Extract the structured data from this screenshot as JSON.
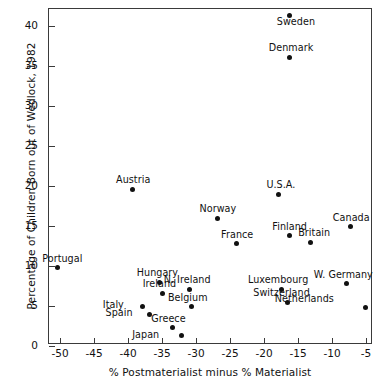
{
  "chart_data": {
    "type": "scatter",
    "title": "",
    "xlabel": "% Postmaterialist minus % Materialist",
    "ylabel": "Percentage of Children Born out of Wedlock, 1982",
    "xlim": [
      -52.5,
      -3.5
    ],
    "ylim": [
      -0.6,
      42.0
    ],
    "xticks": [
      -50,
      -45,
      -40,
      -35,
      -30,
      -25,
      -20,
      -15,
      -10,
      -5
    ],
    "yticks": [
      0,
      5,
      10,
      15,
      20,
      25,
      30,
      35,
      40
    ],
    "xticklabels": [
      "-50",
      "-45",
      "-40",
      "-35",
      "-30",
      "-25",
      "-20",
      "-15",
      "-10",
      "-5"
    ],
    "yticklabels": [
      "0",
      "5",
      "10",
      "15",
      "20",
      "25",
      "30",
      "35",
      "40"
    ],
    "grid": false,
    "legend": false,
    "marker_color": "#111111",
    "frame_color": "#3a3a3a",
    "points": [
      {
        "label": "Sweden",
        "x": -16.2,
        "y": 41.3,
        "lx": 6,
        "ly": 11
      },
      {
        "label": "Denmark",
        "x": -16.2,
        "y": 36.1,
        "lx": 1,
        "ly": -4
      },
      {
        "label": "Austria",
        "x": -39.4,
        "y": 19.6,
        "lx": 1,
        "ly": -4
      },
      {
        "label": "U.S.A.",
        "x": -17.8,
        "y": 19.0,
        "lx": 2,
        "ly": -4
      },
      {
        "label": "Norway",
        "x": -26.9,
        "y": 16.0,
        "lx": 1,
        "ly": -4
      },
      {
        "label": "Canada",
        "x": -7.3,
        "y": 14.9,
        "lx": 1,
        "ly": -4
      },
      {
        "label": "Finland",
        "x": -16.2,
        "y": 13.8,
        "lx": 0,
        "ly": -4
      },
      {
        "label": "Britain",
        "x": -13.2,
        "y": 13.0,
        "lx": 4,
        "ly": -4
      },
      {
        "label": "France",
        "x": -24.1,
        "y": 12.8,
        "lx": 1,
        "ly": -4
      },
      {
        "label": "Portugal",
        "x": -50.4,
        "y": 9.8,
        "lx": 5,
        "ly": -4
      },
      {
        "label": "Hungary",
        "x": -35.4,
        "y": 8.0,
        "lx": -2,
        "ly": -4
      },
      {
        "label": "N. Ireland",
        "x": -31.0,
        "y": 7.1,
        "lx": -2,
        "ly": -4
      },
      {
        "label": "Luxembourg",
        "x": -17.5,
        "y": 7.1,
        "lx": -3,
        "ly": -4
      },
      {
        "label": "W. Germany",
        "x": -7.9,
        "y": 7.8,
        "lx": -3,
        "ly": -4
      },
      {
        "label": "Ireland",
        "x": -34.9,
        "y": 6.6,
        "lx": -3,
        "ly": -4
      },
      {
        "label": "Switzerland",
        "x": -16.5,
        "y": 5.5,
        "lx": -6,
        "ly": -4
      },
      {
        "label": "Belgium",
        "x": -30.6,
        "y": 4.9,
        "lx": -4,
        "ly": -4
      },
      {
        "label": "Italy",
        "x": -37.9,
        "y": 5.0,
        "lx": -29,
        "ly": 4
      },
      {
        "label": "Netherlands",
        "x": -5.1,
        "y": 4.8,
        "lx": -61,
        "ly": -4
      },
      {
        "label": "Spain",
        "x": -36.9,
        "y": 4.0,
        "lx": -30,
        "ly": 4
      },
      {
        "label": "Greece",
        "x": -33.5,
        "y": 2.3,
        "lx": -4,
        "ly": -4
      },
      {
        "label": "Japan",
        "x": -32.1,
        "y": 1.3,
        "lx": -36,
        "ly": 4
      }
    ]
  }
}
